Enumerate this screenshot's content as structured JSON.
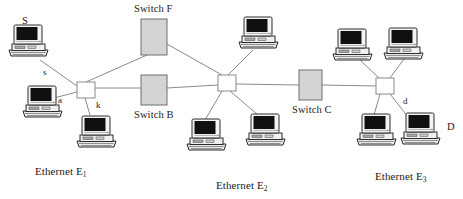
{
  "diagram": {
    "colors": {
      "line": "#8a8a8a",
      "switch_fill": "#d4d4d4",
      "switch_border": "#6e6e6e",
      "hub_fill": "#ffffff",
      "hub_border": "#8a8a8a",
      "text": "#1a1a1a",
      "monitor_screen": "#101010",
      "computer_body": "#f2f2f2",
      "computer_outline": "#2b2b2b",
      "background": "#ffffff"
    },
    "switches": [
      {
        "id": "switch-f",
        "label": "Switch F",
        "x": 141,
        "y": 19,
        "w": 26,
        "h": 36,
        "label_x": 134,
        "label_y": 4
      },
      {
        "id": "switch-b",
        "label": "Switch B",
        "x": 141,
        "y": 75,
        "w": 26,
        "h": 30,
        "label_x": 134,
        "label_y": 110
      },
      {
        "id": "switch-c",
        "label": "Switch C",
        "x": 299,
        "y": 70,
        "w": 23,
        "h": 30,
        "label_x": 292,
        "label_y": 105
      }
    ],
    "hubs": [
      {
        "id": "hub-e1",
        "x": 77,
        "y": 82,
        "w": 18,
        "h": 16
      },
      {
        "id": "hub-e2",
        "x": 218,
        "y": 75,
        "w": 18,
        "h": 16
      },
      {
        "id": "hub-e3",
        "x": 376,
        "y": 78,
        "w": 18,
        "h": 16
      }
    ],
    "computers": [
      {
        "id": "pc-s-upper",
        "x": 8,
        "y": 24,
        "scale": 1.0
      },
      {
        "id": "pc-a",
        "x": 22,
        "y": 85,
        "scale": 1.0
      },
      {
        "id": "pc-k",
        "x": 76,
        "y": 115,
        "scale": 1.0
      },
      {
        "id": "pc-e2-top",
        "x": 238,
        "y": 16,
        "scale": 1.0
      },
      {
        "id": "pc-e2-left",
        "x": 186,
        "y": 118,
        "scale": 1.0
      },
      {
        "id": "pc-e2-right",
        "x": 245,
        "y": 113,
        "scale": 1.0
      },
      {
        "id": "pc-e3-topl",
        "x": 332,
        "y": 28,
        "scale": 1.0
      },
      {
        "id": "pc-e3-topr",
        "x": 383,
        "y": 27,
        "scale": 1.0
      },
      {
        "id": "pc-e3-botl",
        "x": 356,
        "y": 113,
        "scale": 1.0
      },
      {
        "id": "pc-d",
        "x": 400,
        "y": 112,
        "scale": 1.0
      }
    ],
    "links": [
      {
        "id": "link-s-hub1",
        "x1": 40,
        "y1": 60,
        "x2": 77,
        "y2": 86
      },
      {
        "id": "link-a-hub1",
        "x1": 54,
        "y1": 98,
        "x2": 77,
        "y2": 92
      },
      {
        "id": "link-k-hub1",
        "x1": 90,
        "y1": 115,
        "x2": 85,
        "y2": 98
      },
      {
        "id": "link-hub1-switchf",
        "x1": 86,
        "y1": 82,
        "x2": 147,
        "y2": 55
      },
      {
        "id": "link-hub1-switchb",
        "x1": 95,
        "y1": 88,
        "x2": 141,
        "y2": 88
      },
      {
        "id": "link-switchf-hub2",
        "x1": 167,
        "y1": 44,
        "x2": 222,
        "y2": 75
      },
      {
        "id": "link-switchb-hub2",
        "x1": 167,
        "y1": 88,
        "x2": 218,
        "y2": 85
      },
      {
        "id": "link-hub2-pctop",
        "x1": 228,
        "y1": 75,
        "x2": 253,
        "y2": 50
      },
      {
        "id": "link-hub2-pcleft",
        "x1": 222,
        "y1": 91,
        "x2": 205,
        "y2": 120
      },
      {
        "id": "link-hub2-pcright",
        "x1": 230,
        "y1": 91,
        "x2": 258,
        "y2": 115
      },
      {
        "id": "link-hub2-switchc",
        "x1": 236,
        "y1": 84,
        "x2": 299,
        "y2": 85
      },
      {
        "id": "link-switchc-hub3",
        "x1": 322,
        "y1": 85,
        "x2": 376,
        "y2": 86
      },
      {
        "id": "link-hub3-pctopl",
        "x1": 379,
        "y1": 78,
        "x2": 360,
        "y2": 60
      },
      {
        "id": "link-hub3-pctopr",
        "x1": 390,
        "y1": 78,
        "x2": 404,
        "y2": 59
      },
      {
        "id": "link-hub3-pcbotl",
        "x1": 380,
        "y1": 94,
        "x2": 374,
        "y2": 115
      },
      {
        "id": "link-hub3-pcd",
        "x1": 390,
        "y1": 94,
        "x2": 412,
        "y2": 122
      }
    ],
    "node_labels": [
      {
        "id": "label-S-upper",
        "text": "S",
        "x": 22,
        "y": 16,
        "size": "big"
      },
      {
        "id": "label-s-link",
        "text": "s",
        "x": 43,
        "y": 68,
        "size": "small"
      },
      {
        "id": "label-a-link",
        "text": "a",
        "x": 58,
        "y": 96,
        "size": "small"
      },
      {
        "id": "label-k-link",
        "text": "k",
        "x": 96,
        "y": 101,
        "size": "small"
      },
      {
        "id": "label-d-link",
        "text": "d",
        "x": 403,
        "y": 97,
        "size": "small"
      },
      {
        "id": "label-D-node",
        "text": "D",
        "x": 447,
        "y": 122,
        "size": "big"
      }
    ],
    "ethernet_labels": [
      {
        "id": "ethernet-e1",
        "prefix": "Ethernet E",
        "subscript": "1",
        "x": 35,
        "y": 166
      },
      {
        "id": "ethernet-e2",
        "prefix": "Ethernet E",
        "subscript": "2",
        "x": 216,
        "y": 180
      },
      {
        "id": "ethernet-e3",
        "prefix": "Ethernet E",
        "subscript": "3",
        "x": 375,
        "y": 171
      }
    ]
  }
}
